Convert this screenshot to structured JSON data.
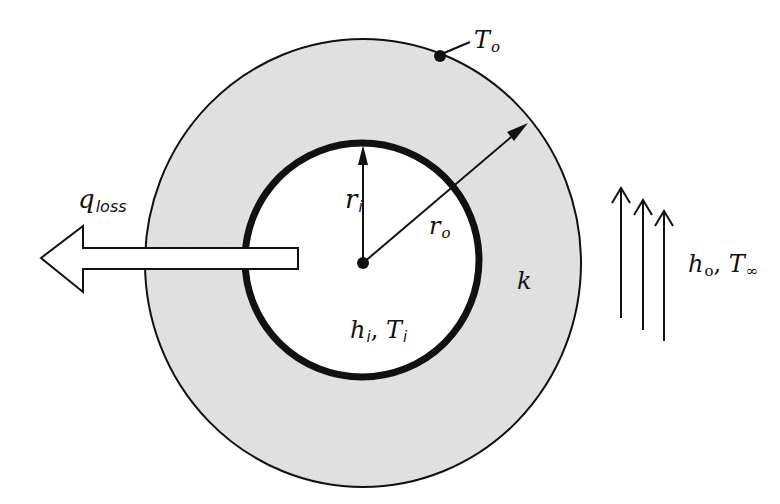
{
  "diagram": {
    "colors": {
      "insulation_fill": "#e6e6e6",
      "stroke": "#111111",
      "background": "#ffffff",
      "arrow_fill": "#ffffff"
    },
    "labels": {
      "q_loss": {
        "main": "q",
        "sub": "loss"
      },
      "r_i": {
        "main": "r",
        "sub": "i"
      },
      "r_o": {
        "main": "r",
        "sub": "o"
      },
      "h_i_T_i": {
        "main1": "h",
        "sub1": "i",
        "sep": ", ",
        "main2": "T",
        "sub2": "i"
      },
      "k": {
        "main": "k"
      },
      "T_o": {
        "main": "T",
        "sub": "o"
      },
      "h_o_T_inf": {
        "main1": "h",
        "sub1": "o",
        "sep": ", ",
        "main2": "T",
        "sub2": "∞"
      }
    },
    "geometry": {
      "outer_circle": {
        "cx": 363,
        "cy": 263,
        "rx": 218,
        "ry": 224
      },
      "inner_circle": {
        "cx": 362,
        "cy": 260,
        "r": 117,
        "stroke_width": 7
      },
      "center_point": {
        "x": 363,
        "y": 263
      },
      "surface_point_T_o": {
        "x": 440,
        "y": 56
      },
      "heat_loss_arrow": {
        "tip_x": 41,
        "tip_y": 258,
        "head_base_x": 83,
        "head_top_y": 226,
        "head_bottom_y": 292,
        "shaft_top_y": 248,
        "shaft_bottom_y": 269,
        "shaft_end_x": 298
      },
      "flow_arrows": [
        {
          "x": 621,
          "top": 187,
          "bottom": 318
        },
        {
          "x": 643,
          "top": 199,
          "bottom": 330
        },
        {
          "x": 664,
          "top": 210,
          "bottom": 341
        }
      ]
    }
  }
}
